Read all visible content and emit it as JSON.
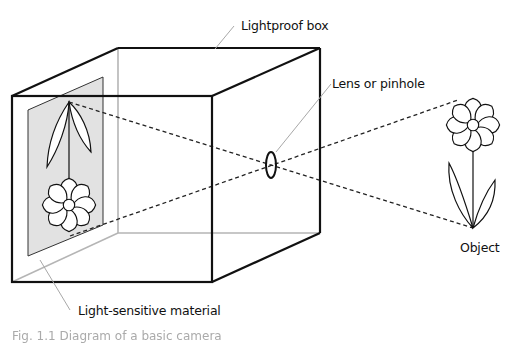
{
  "labels": {
    "box": "Lightproof box",
    "lens": "Lens or pinhole",
    "object": "Object",
    "film": "Light-sensitive material"
  },
  "caption": "Fig. 1.1 Diagram of a basic camera",
  "colors": {
    "outline": "#111111",
    "hidden_edge": "#b0b0b0",
    "film_fill": "#e4e4e4",
    "leader": "#a8a8a8"
  }
}
